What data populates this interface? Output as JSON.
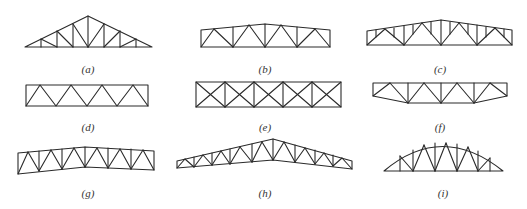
{
  "figure": {
    "panels": [
      {
        "id": "a",
        "label": "(a)",
        "type": "triangular truss"
      },
      {
        "id": "b",
        "label": "(b)",
        "type": "slightly pitched parallel-chord truss"
      },
      {
        "id": "c",
        "label": "(c)",
        "type": "pitched truss with sub-divided panels"
      },
      {
        "id": "d",
        "label": "(d)",
        "type": "parallel-chord Warren truss"
      },
      {
        "id": "e",
        "label": "(e)",
        "type": "cross-braced parallel-chord truss"
      },
      {
        "id": "f",
        "label": "(f)",
        "type": "trapezoidal truss with sloped bottom ends"
      },
      {
        "id": "g",
        "label": "(g)",
        "type": "cambered parallel truss"
      },
      {
        "id": "h",
        "label": "(h)",
        "type": "long-span pitched truss"
      },
      {
        "id": "i",
        "label": "(i)",
        "type": "arched (bowstring) truss"
      }
    ],
    "line_color": "#2a2a2a"
  }
}
